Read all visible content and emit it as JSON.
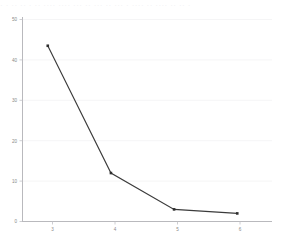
{
  "top_artifact": {
    "text": "· · ·· ·· · ·· ···· ···· ··· ·· ··· ·· ··· · ···· ·· ···· ·· ·· ·"
  },
  "chart_data": {
    "type": "line",
    "title": "",
    "subtitle": "",
    "xlabel": "",
    "ylabel": "",
    "categories": [
      "3",
      "4",
      "5",
      "6"
    ],
    "x": [
      3,
      4,
      5,
      6
    ],
    "values": [
      43.5,
      12,
      3,
      2
    ],
    "series": [
      {
        "name": "",
        "values": [
          43.5,
          12,
          3,
          2
        ]
      }
    ],
    "ylim": [
      0,
      50
    ],
    "xlim": [
      2.6,
      6.55
    ],
    "yticks": [
      0,
      10,
      20,
      30,
      40,
      50
    ],
    "ytick_labels": [
      "0",
      "10",
      "20",
      "30",
      "40",
      "50"
    ],
    "xticks": [
      3,
      4,
      5,
      6
    ],
    "xtick_labels": [
      "3",
      "4",
      "5",
      "6"
    ],
    "grid": "horizontal",
    "legend": "none",
    "markers": true,
    "colors": {
      "line": "#3b3b3b",
      "marker": "#2e2e2e",
      "grid": "#f2f2f4",
      "axis": "#b9b9bd",
      "tick_text": "#8a8a8a",
      "background": "#ffffff"
    }
  }
}
